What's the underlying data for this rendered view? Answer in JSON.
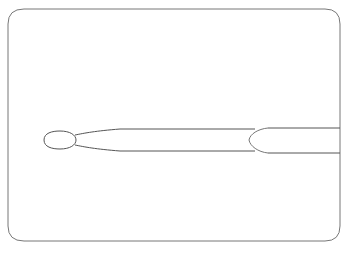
{
  "figure": {
    "stroke_color": "#555555",
    "frame_color": "#777777",
    "background": "#ffffff",
    "caption": ""
  }
}
